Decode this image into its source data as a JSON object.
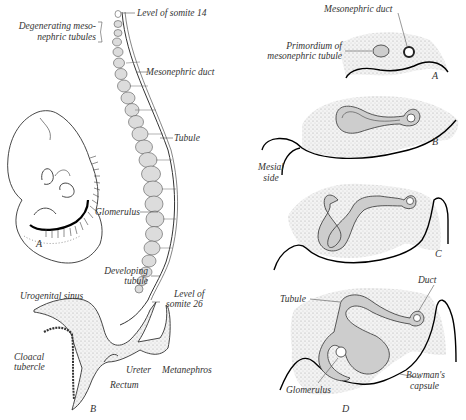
{
  "figure": {
    "left": {
      "labels": {
        "somite14": "Level of somite 14",
        "degenerating1": "Degenerating meso-",
        "degenerating2": "nephric tubules",
        "meso_duct": "Mesonephric duct",
        "tubule": "Tubule",
        "glomerulus": "Glomerulus",
        "developing1": "Developing",
        "developing2": "tubule",
        "somite26_1": "Level of",
        "somite26_2": "somite 26",
        "urogenital": "Urogenital sinus",
        "cloacal1": "Cloacal",
        "cloacal2": "tubercle",
        "ureter": "Ureter",
        "metanephros": "Metanephros",
        "rectum": "Rectum"
      },
      "panels": {
        "embryo": "A",
        "system": "B"
      }
    },
    "right": {
      "labels": {
        "meso_duct": "Mesonephric duct",
        "primordium1": "Primordium of",
        "primordium2": "mesonephric tubule",
        "mesial1": "Mesial",
        "mesial2": "side",
        "duct": "Duct",
        "tubule": "Tubule",
        "glomerulus": "Glomerulus",
        "bowman1": "Bowman's",
        "bowman2": "capsule"
      },
      "panels": {
        "a": "A",
        "b": "B",
        "c": "C",
        "d": "D"
      }
    }
  }
}
